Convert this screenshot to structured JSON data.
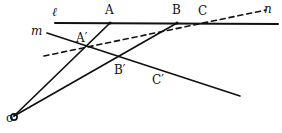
{
  "figure": {
    "kind": "geometry-diagram",
    "background_color": "#ffffff",
    "ink_color": "#111111",
    "width": 282,
    "height": 133
  },
  "labels": [
    {
      "id": "l",
      "text": "ℓ",
      "x": 52,
      "y": 6,
      "style": "italic",
      "size": "big"
    },
    {
      "id": "A",
      "text": "A",
      "x": 105,
      "y": 4,
      "style": "normal",
      "size": "big"
    },
    {
      "id": "B",
      "text": "B",
      "x": 172,
      "y": 4,
      "style": "normal",
      "size": "big"
    },
    {
      "id": "C",
      "text": "C",
      "x": 198,
      "y": 5,
      "style": "normal",
      "size": "big"
    },
    {
      "id": "n",
      "text": "n",
      "x": 264,
      "y": 3,
      "style": "italic",
      "size": "big"
    },
    {
      "id": "m",
      "text": "m",
      "x": 31,
      "y": 25,
      "style": "italic",
      "size": "big"
    },
    {
      "id": "Aprime",
      "text": "A′",
      "x": 76,
      "y": 32,
      "style": "normal",
      "size": "big"
    },
    {
      "id": "Bprime",
      "text": "B′",
      "x": 114,
      "y": 64,
      "style": "normal",
      "size": "big"
    },
    {
      "id": "Cprime",
      "text": "C′",
      "x": 152,
      "y": 74,
      "style": "normal",
      "size": "big"
    },
    {
      "id": "O",
      "text": "o",
      "x": 6,
      "y": 112,
      "style": "normal",
      "size": "big"
    }
  ],
  "points": [
    {
      "id": "O",
      "name": "point-o",
      "x": 14,
      "y": 117,
      "marker": "circle",
      "r": 3.1
    },
    {
      "id": "A",
      "name": "point-a",
      "x": 110,
      "y": 23,
      "marker": "dot",
      "r": 1.6
    },
    {
      "id": "B",
      "name": "point-b",
      "x": 177,
      "y": 23,
      "marker": "dot",
      "r": 1.6
    },
    {
      "id": "Aprime",
      "name": "point-a-prime",
      "x": 85,
      "y": 48,
      "marker": "none",
      "r": 0
    },
    {
      "id": "Bprime",
      "name": "point-b-prime",
      "x": 122,
      "y": 61,
      "marker": "none",
      "r": 0
    }
  ],
  "segments": [
    {
      "id": "line-l",
      "name": "line-l",
      "description": "horizontal line ℓ through A, B, C",
      "x1": 55,
      "y1": 23,
      "x2": 278,
      "y2": 24,
      "dash": "none",
      "width": 2.0
    },
    {
      "id": "line-m",
      "name": "line-m",
      "description": "line m through A′, B′, C′",
      "x1": 47,
      "y1": 33,
      "x2": 240,
      "y2": 96,
      "dash": "none",
      "width": 1.7
    },
    {
      "id": "line-n",
      "name": "line-n-dashed",
      "description": "dashed line n through A′ meeting ℓ near C",
      "x1": 44,
      "y1": 56,
      "x2": 266,
      "y2": 10,
      "dash": "5,4",
      "width": 1.6
    },
    {
      "id": "ray-oa",
      "name": "ray-o-to-a",
      "description": "ray from O through A′ to A",
      "x1": 14,
      "y1": 116,
      "x2": 110,
      "y2": 23,
      "dash": "none",
      "width": 1.7
    },
    {
      "id": "ray-ob",
      "name": "ray-o-to-b",
      "description": "ray from O through B′ to B",
      "x1": 14,
      "y1": 116,
      "x2": 177,
      "y2": 23,
      "dash": "none",
      "width": 1.7
    }
  ],
  "chart_data": {
    "type": "scatter",
    "xlabel": "",
    "ylabel": "",
    "xlim": [
      0,
      282
    ],
    "ylim": [
      0,
      133
    ],
    "grid": false,
    "legend": "none",
    "annotations": [
      "ℓ",
      "A",
      "B",
      "C",
      "n",
      "m",
      "A′",
      "B′",
      "C′",
      "o"
    ]
  }
}
